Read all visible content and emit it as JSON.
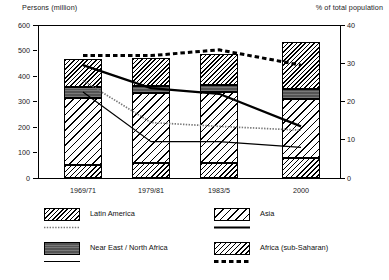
{
  "chart_data": {
    "type": "bar",
    "title": "",
    "subtitle": "",
    "ylabel": "Persons (million)",
    "y2label": "% of total population",
    "xlabel": "",
    "categories": [
      "1969/71",
      "1979/81",
      "1983/5",
      "2000"
    ],
    "ylim": [
      0,
      600
    ],
    "y2lim": [
      0,
      40
    ],
    "yticks": [
      0,
      100,
      200,
      300,
      400,
      500,
      600
    ],
    "y2ticks": [
      0,
      10,
      20,
      30,
      40
    ],
    "grid": false,
    "legend_position": "bottom",
    "stacked": true,
    "bar_series": [
      {
        "name": "Africa (sub-Saharan)",
        "values": [
          50,
          58,
          58,
          80
        ]
      },
      {
        "name": "Asia",
        "values": [
          265,
          275,
          280,
          230
        ]
      },
      {
        "name": "Near East / North Africa",
        "values": [
          40,
          27,
          25,
          38
        ]
      },
      {
        "name": "Latin America",
        "values": [
          110,
          110,
          122,
          187
        ]
      }
    ],
    "bar_totals": [
      465,
      470,
      485,
      535
    ],
    "line_series": [
      {
        "name": "Latin America",
        "style": "dotted-fine",
        "values": [
          25.5,
          14.5,
          13.5,
          12.5
        ]
      },
      {
        "name": "Near East / North Africa",
        "style": "solid-thin",
        "values": [
          22.5,
          9.5,
          9.5,
          8.0
        ]
      },
      {
        "name": "Asia",
        "style": "solid-thick",
        "values": [
          29.5,
          23.5,
          22.0,
          13.5
        ]
      },
      {
        "name": "Africa (sub-Saharan)",
        "style": "dashed-bold",
        "values": [
          32.0,
          32.0,
          33.5,
          29.5
        ]
      }
    ]
  },
  "legend": {
    "left": [
      {
        "key": "latin-america",
        "label": "Latin America",
        "swatch": "p-latin",
        "line": "dotted-fine"
      },
      {
        "key": "near-east",
        "label": "Near East / North Africa",
        "swatch": "p-neareast",
        "line": "solid-thin"
      }
    ],
    "right": [
      {
        "key": "asia",
        "label": "Asia",
        "swatch": "p-asia",
        "line": "solid-thick"
      },
      {
        "key": "africa",
        "label": "Africa (sub-Saharan)",
        "swatch": "p-africa",
        "line": "dashed-bold"
      }
    ]
  }
}
